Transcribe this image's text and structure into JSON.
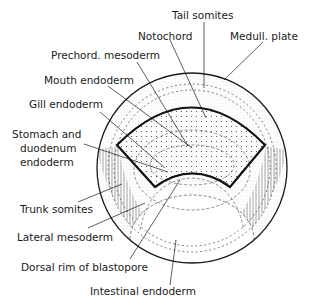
{
  "figure": {
    "type": "embryo fate map (gastrula, dorsal view)",
    "colors": {
      "ink": "#1a1a1a",
      "background": "#ffffff"
    },
    "labels": {
      "tail_somites": "Tail somites",
      "notochord": "Notochord",
      "medull_plate": "Medull. plate",
      "prechord_mesoderm": "Prechord. mesoderm",
      "mouth_endoderm": "Mouth endoderm",
      "gill_endoderm": "Gill endoderm",
      "stomach_line1": "Stomach and",
      "stomach_line2": "duodenum",
      "stomach_line3": "endoderm",
      "trunk_somites": "Trunk somites",
      "lateral_mesoderm": "Lateral mesoderm",
      "dorsal_rim": "Dorsal rim of blastopore",
      "intestinal_endoderm": "Intestinal endoderm"
    }
  }
}
